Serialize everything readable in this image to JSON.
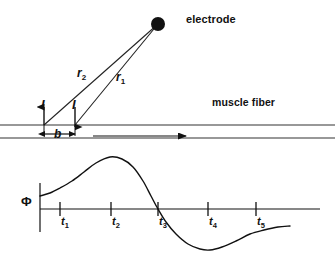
{
  "figure": {
    "upper_panel": {
      "electrode_label": "electrode",
      "muscle_fiber_label": "muscle fiber",
      "distance_r1_label": "r",
      "distance_r1_sub": "1",
      "distance_r2_label": "r",
      "distance_r2_sub": "2",
      "current_source_label": "I",
      "current_sink_label": "I",
      "dipole_separation_label": "b",
      "electrode_point": {
        "x": 158,
        "y": 24,
        "radius": 7
      },
      "source_point": {
        "x": 44,
        "y": 125
      },
      "sink_point": {
        "x": 75,
        "y": 125
      },
      "fiber_top_y": 125,
      "fiber_bottom_y": 138,
      "propagation_arrow": {
        "x_start": 93,
        "x_end": 190,
        "y": 136
      }
    },
    "lower_panel": {
      "y_axis_label": "Φ",
      "tick_labels": [
        "t",
        "t",
        "t",
        "t",
        "t"
      ],
      "tick_subscripts": [
        "1",
        "2",
        "3",
        "4",
        "5"
      ],
      "tick_x": [
        60,
        111,
        158,
        208,
        256
      ],
      "baseline_y": 209,
      "axis_x_start": 40,
      "axis_x_end": 320,
      "y_axis_top": 183,
      "y_axis_bottom": 232
    }
  },
  "chart_data": {
    "type": "line",
    "xlabel": "",
    "ylabel": "Φ",
    "grid": false,
    "legend": null,
    "axis_origin_x": 40,
    "baseline_y": 209,
    "xticks": [
      60,
      111,
      158,
      208,
      256
    ],
    "xtick_labels": [
      "t1",
      "t2",
      "t3",
      "t4",
      "t5"
    ],
    "points": [
      {
        "x": 40,
        "y": 196
      },
      {
        "x": 50,
        "y": 193
      },
      {
        "x": 60,
        "y": 188
      },
      {
        "x": 72,
        "y": 181
      },
      {
        "x": 84,
        "y": 172
      },
      {
        "x": 96,
        "y": 163
      },
      {
        "x": 110,
        "y": 157
      },
      {
        "x": 122,
        "y": 159
      },
      {
        "x": 133,
        "y": 167
      },
      {
        "x": 143,
        "y": 181
      },
      {
        "x": 151,
        "y": 196
      },
      {
        "x": 158,
        "y": 209
      },
      {
        "x": 166,
        "y": 222
      },
      {
        "x": 176,
        "y": 234
      },
      {
        "x": 188,
        "y": 244
      },
      {
        "x": 200,
        "y": 249
      },
      {
        "x": 210,
        "y": 250
      },
      {
        "x": 222,
        "y": 247
      },
      {
        "x": 236,
        "y": 241
      },
      {
        "x": 250,
        "y": 234
      },
      {
        "x": 264,
        "y": 230
      },
      {
        "x": 278,
        "y": 227
      },
      {
        "x": 290,
        "y": 226
      }
    ],
    "key_features": {
      "positive_peak": {
        "x": 110,
        "y": 157
      },
      "zero_crossing": {
        "x": 158,
        "y": 209
      },
      "negative_trough": {
        "x": 210,
        "y": 250
      },
      "curve_start": {
        "x": 40,
        "y": 196
      },
      "curve_end": {
        "x": 290,
        "y": 226
      }
    }
  },
  "colors": {
    "ink": "#111111",
    "line": "#222222",
    "background": "#ffffff"
  }
}
